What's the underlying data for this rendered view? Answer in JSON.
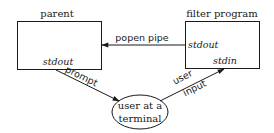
{
  "diagram": {
    "nodes": {
      "parent": {
        "title": "parent",
        "port_bottom": "stdout"
      },
      "filter": {
        "title": "filter program",
        "port_left": "stdout",
        "port_bottom": "stdin"
      },
      "terminal": {
        "line1": "user at a",
        "line2": "terminal"
      }
    },
    "edges": {
      "popen": {
        "label": "popen pipe",
        "from": "filter program stdout",
        "to": "parent"
      },
      "prompt": {
        "label": "prompt",
        "from": "parent stdout",
        "to": "user at a terminal"
      },
      "input": {
        "label_line1": "user",
        "label_line2": "input",
        "from": "user at a terminal",
        "to": "filter program stdin"
      }
    },
    "colors": {
      "stroke": "#1a1a1a",
      "background": "#ffffff"
    }
  }
}
